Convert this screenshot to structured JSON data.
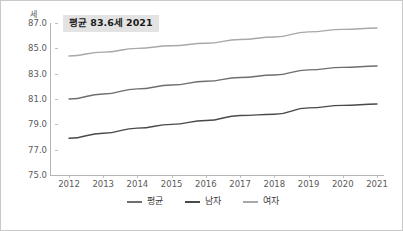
{
  "chart_data": {
    "type": "line",
    "title": "",
    "annotation": "평균 83.6세 2021",
    "unit_label": "세",
    "xlabel": "",
    "ylabel": "세",
    "grid": false,
    "legend_position": "bottom",
    "categories": [
      "2012",
      "2013",
      "2014",
      "2015",
      "2016",
      "2017",
      "2018",
      "2019",
      "2020",
      "2021"
    ],
    "x": [
      2012,
      2013,
      2014,
      2015,
      2016,
      2017,
      2018,
      2019,
      2020,
      2021
    ],
    "ylim": [
      75.0,
      87.0
    ],
    "yticks": [
      "75.0",
      "77.0",
      "79.0",
      "81.0",
      "83.0",
      "85.0",
      "87.0"
    ],
    "ytick_values": [
      75.0,
      77.0,
      79.0,
      81.0,
      83.0,
      85.0,
      87.0
    ],
    "series": [
      {
        "name": "평균",
        "color": "#6e6e6e",
        "values": [
          81.0,
          81.4,
          81.8,
          82.1,
          82.4,
          82.7,
          82.9,
          83.3,
          83.5,
          83.6
        ]
      },
      {
        "name": "남자",
        "color": "#4a4a4a",
        "values": [
          77.9,
          78.3,
          78.7,
          79.0,
          79.3,
          79.7,
          79.8,
          80.3,
          80.5,
          80.6
        ]
      },
      {
        "name": "여자",
        "color": "#a8a8a8",
        "values": [
          84.4,
          84.7,
          85.0,
          85.2,
          85.4,
          85.7,
          85.9,
          86.3,
          86.5,
          86.6
        ]
      }
    ]
  },
  "legend": {
    "items": [
      {
        "label": "평균",
        "color": "#6e6e6e"
      },
      {
        "label": "남자",
        "color": "#4a4a4a"
      },
      {
        "label": "여자",
        "color": "#a8a8a8"
      }
    ]
  },
  "colors": {
    "border": "#c9c9c9",
    "axis": "#b5b5b5",
    "tick_text": "#5a5a5a",
    "annotation_bg": "#e3e3e3",
    "annotation_text": "#1a1a1a"
  }
}
